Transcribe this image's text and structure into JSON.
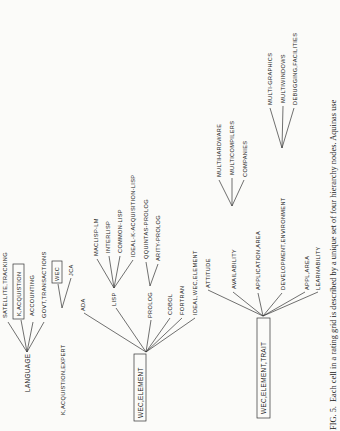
{
  "figure": {
    "orientation": "rotated-90-ccw",
    "caption_label": "FIG. 5.",
    "caption_text": "Each cell in a rating grid is described by a unique set of four hierarchy nodes. Aquinas use",
    "trees": [
      {
        "root": "LANGUAGE",
        "children": [
          "SATELLITE,TRACKING",
          "K,ACQUISTION",
          "ACCOUNTING",
          "GOVT,TRANSACTIONS"
        ],
        "boxed": [
          "K,ACQUISTION"
        ]
      },
      {
        "root": "K,ACQUISTION,EXPERT",
        "children": [
          "WEC",
          "JCA"
        ],
        "boxed": [
          "WEC"
        ]
      },
      {
        "root": "WEC,ELEMENT",
        "root_boxed": true,
        "children": [
          {
            "label": "ADA"
          },
          {
            "label": "LISP",
            "children": [
              "MACLISP-LM",
              "INTERLISP",
              "COMMON-LISP",
              "IDEAL-K-ACQUISITION-LISP"
            ]
          },
          {
            "label": "PROLOG",
            "children": [
              "QQUINTAS-PROLOG",
              "ARITY-PROLOG"
            ]
          },
          {
            "label": "COBOL"
          },
          {
            "label": "FORTRAN"
          },
          {
            "label": "IDEAL,WEC,ELEMENT"
          }
        ]
      },
      {
        "root": "WEC,ELEMENT,TRAIT",
        "root_boxed": true,
        "children": [
          {
            "label": "ATTITUDE"
          },
          {
            "label": "AVAILABILITY",
            "children": [
              "MULTIHARDWARE",
              "MULTICOMPILERS",
              "COMPANIES"
            ]
          },
          {
            "label": "APPLICATION,AREA"
          },
          {
            "label": "DEVELOPMENT,ENVIRONMENT",
            "children": [
              "MULTI-GRAPHICS",
              "MULTIWINDOWS",
              "DEBUGGING,FACILITIES"
            ]
          },
          {
            "label": "APPL,AREA"
          },
          {
            "label": "LEARNABILITY"
          }
        ]
      }
    ]
  },
  "labels": {
    "language": "LANGUAGE",
    "satellite_tracking": "SATELLITE,TRACKING",
    "k_acquistion": "K,ACQUISTION",
    "accounting": "ACCOUNTING",
    "govt_transactions": "GOVT,TRANSACTIONS",
    "k_acquistion_expert": "K,ACQUISTION,EXPERT",
    "wec": "WEC",
    "jca": "JCA",
    "wec_element": "WEC,ELEMENT",
    "ada": "ADA",
    "lisp": "LISP",
    "maclisp_lm": "MACLISP-LM",
    "interlisp": "INTERLISP",
    "common_lisp": "COMMON-LISP",
    "ideal_k_acq_lisp": "IDEAL-K-ACQUISITION-LISP",
    "prolog": "PROLOG",
    "qquintas_prolog": "QQUINTAS-PROLOG",
    "arity_prolog": "ARITY-PROLOG",
    "cobol": "COBOL",
    "fortran": "FORTRAN",
    "ideal_wec_element": "IDEAL,WEC,ELEMENT",
    "wec_element_trait": "WEC,ELEMENT,TRAIT",
    "attitude": "ATTITUDE",
    "availability": "AVAILABILITY",
    "multihardware": "MULTIHARDWARE",
    "multicompilers": "MULTICOMPILERS",
    "companies": "COMPANIES",
    "application_area": "APPLICATION,AREA",
    "development_environment": "DEVELOPMENT,ENVIRONMENT",
    "multi_graphics": "MULTI-GRAPHICS",
    "multiwindows": "MULTIWINDOWS",
    "debugging_facilities": "DEBUGGING,FACILITIES",
    "appl_area": "APPL,AREA",
    "learnability": "LEARNABILITY"
  }
}
